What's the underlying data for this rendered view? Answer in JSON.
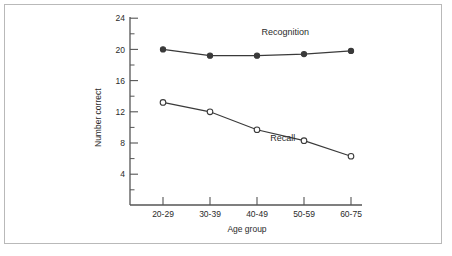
{
  "figure": {
    "border_color": "#b9b9b9",
    "background": "#ffffff",
    "axis_color": "#555555",
    "text_color": "#2b2b2b"
  },
  "chart_data": {
    "type": "line",
    "title": "",
    "xlabel": "Age group",
    "ylabel": "Number correct",
    "categories": [
      "20-29",
      "30-39",
      "40-49",
      "50-59",
      "60-75"
    ],
    "yticks": [
      4,
      8,
      12,
      16,
      20,
      24
    ],
    "ytick_labels": [
      "4",
      "8",
      "12",
      "16",
      "20",
      "24"
    ],
    "ylim": [
      0,
      24
    ],
    "minor_ticks": true,
    "grid": false,
    "legend_position": "inline-annotation",
    "series": [
      {
        "name": "Recognition",
        "values": [
          20.0,
          19.2,
          19.2,
          19.4,
          19.8
        ],
        "marker": "filled-circle",
        "color": "#3a3a3a",
        "label_x_category_index": 2.6,
        "label_y": 21.9
      },
      {
        "name": "Recall",
        "values": [
          13.2,
          12.0,
          9.7,
          8.3,
          6.3
        ],
        "marker": "open-circle",
        "color": "#3a3a3a",
        "label_x_category_index": 2.55,
        "label_y": 8.3
      }
    ],
    "annotations": [
      {
        "text": "Recognition",
        "series": "Recognition"
      },
      {
        "text": "Recall",
        "series": "Recall"
      }
    ]
  }
}
